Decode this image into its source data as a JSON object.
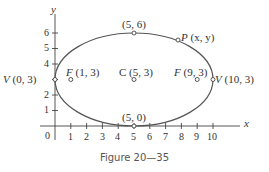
{
  "caption": "Figure 20—35",
  "axes": {
    "x_label": "x",
    "y_label": "y",
    "origin_label": "0",
    "x_ticks": [
      "1",
      "2",
      "3",
      "4",
      "5",
      "6",
      "7",
      "8",
      "9",
      "10"
    ],
    "y_ticks": [
      "1",
      "2",
      "3",
      "4",
      "5",
      "6"
    ]
  },
  "points": {
    "left_vertex": {
      "letter": "V",
      "coords": "(0, 3)"
    },
    "right_vertex": {
      "letter": "V",
      "coords": "(10, 3)"
    },
    "left_focus": {
      "letter": "F",
      "coords": "(1, 3)"
    },
    "right_focus": {
      "letter": "F",
      "coords": "(9, 3)"
    },
    "center": {
      "letter": "C",
      "coords": "(5, 3)"
    },
    "top": {
      "coords": "(5, 6)"
    },
    "bottom": {
      "coords": "(5, 0)"
    },
    "point_p": {
      "letter": "P",
      "coords": "(x, y)"
    }
  },
  "ellipse": {
    "center": [
      5,
      3
    ],
    "a": 5,
    "b": 3,
    "foci": [
      [
        1,
        3
      ],
      [
        9,
        3
      ]
    ]
  },
  "colors": {
    "curve": "#555555",
    "axes": "#444444",
    "text": "#333333"
  }
}
